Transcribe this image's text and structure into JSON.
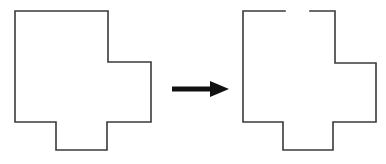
{
  "figure": {
    "title": "Shape transformation diagram",
    "background_color": "#ffffff",
    "canvas": {
      "width": 386,
      "height": 164
    }
  },
  "style": {
    "outline_color": "#3a3a3a",
    "outline_width": 1.6,
    "fill_color": "#ffffff",
    "arrow_color": "#111111"
  },
  "shapes": {
    "left": {
      "label": "source-shape",
      "closed": true,
      "points": "15,11 108,11 108,62 151,62 151,122 107,122 107,150 56,150 56,122 15,122",
      "bounds": {
        "x": 15,
        "y": 11,
        "width": 136,
        "height": 139
      }
    },
    "right": {
      "label": "target-shape",
      "closed": false,
      "gap": {
        "start_x": 285,
        "end_x": 310,
        "y": 11
      },
      "segments": [
        "243,11 285,11",
        "310,11 335,11 335,63 376,63 376,122 333,122 333,150 283,150 283,122 243,122 243,11"
      ],
      "bounds": {
        "x": 243,
        "y": 11,
        "width": 133,
        "height": 139
      }
    }
  },
  "arrow": {
    "label": "transformation-arrow",
    "direction": "right",
    "shaft": {
      "x1": 172,
      "y1": 89,
      "x2": 214,
      "y2": 89,
      "thickness": 5
    },
    "head": "210,81 229,89 210,97"
  }
}
